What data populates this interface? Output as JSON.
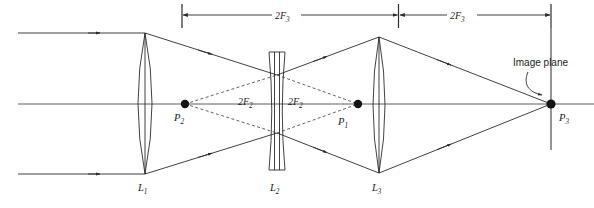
{
  "figure": {
    "type": "optical-ray-diagram",
    "width": 594,
    "height": 208,
    "background_color": "#ffffff",
    "line_color": "#2b2b2b"
  },
  "dimensions": [
    {
      "id": "dim-left",
      "label": "2F",
      "subscript": "3",
      "full_label": "2F3",
      "from": "L2",
      "to": "L3",
      "x_start": 182,
      "x_end": 397,
      "y": 15
    },
    {
      "id": "dim-right",
      "label": "2F",
      "subscript": "3",
      "full_label": "2F3",
      "from": "L3",
      "to": "image-plane",
      "x_start": 400,
      "x_end": 551,
      "y": 15
    }
  ],
  "interior_dimensions": [
    {
      "id": "dim-2f2-left",
      "label": "2F",
      "subscript": "2",
      "full_label": "2F2",
      "x": 243,
      "y": 102
    },
    {
      "id": "dim-2f2-right",
      "label": "2F",
      "subscript": "2",
      "full_label": "2F2",
      "x": 291,
      "y": 102
    }
  ],
  "lenses": [
    {
      "id": "L1",
      "label": "L",
      "subscript": "1",
      "full_label": "L1",
      "kind": "biconvex",
      "x_center": 145,
      "y_top": 33,
      "y_bottom": 174,
      "half_thickness": 7,
      "label_x": 141,
      "label_y": 190
    },
    {
      "id": "L2",
      "label": "L",
      "subscript": "2",
      "full_label": "L2",
      "kind": "biconcave",
      "x_center": 277,
      "y_top": 52,
      "y_bottom": 170,
      "half_thickness": 7,
      "label_x": 272,
      "label_y": 190
    },
    {
      "id": "L3",
      "label": "L",
      "subscript": "3",
      "full_label": "L3",
      "kind": "biconvex",
      "x_center": 379,
      "y_top": 37,
      "y_bottom": 173,
      "half_thickness": 6,
      "label_x": 374,
      "label_y": 190
    }
  ],
  "points": [
    {
      "id": "P2",
      "label": "P",
      "subscript": "2",
      "full_label": "P2",
      "x": 185,
      "y": 104,
      "label_x": 176,
      "label_y": 120
    },
    {
      "id": "P1",
      "label": "P",
      "subscript": "1",
      "full_label": "P1",
      "x": 358,
      "y": 104,
      "label_x": 340,
      "label_y": 124
    },
    {
      "id": "P3",
      "label": "P",
      "subscript": "3",
      "full_label": "P3",
      "x": 551,
      "y": 104,
      "label_x": 559,
      "label_y": 120
    }
  ],
  "annotations": [
    {
      "id": "image-plane",
      "text": "Image plane",
      "text_x": 513,
      "text_y": 68,
      "target_x": 551,
      "target_y": 104
    }
  ],
  "optical_axis": {
    "y": 104,
    "x_start": 18,
    "x_end": 594
  },
  "incoming_rays": [
    {
      "y": 33,
      "x_start": 18,
      "x_end": 145
    },
    {
      "y": 174,
      "x_start": 18,
      "x_end": 145
    }
  ],
  "image_plane_line": {
    "x": 551,
    "y_top": 28,
    "y_bottom": 150
  }
}
